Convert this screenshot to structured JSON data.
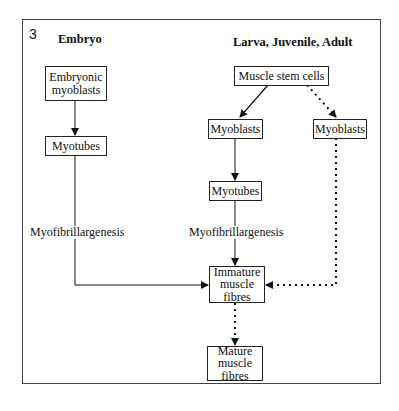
{
  "figure": {
    "panel_number": "3",
    "columns": {
      "left_heading": "Embryo",
      "right_heading": "Larva, Juvenile, Adult"
    },
    "nodes": {
      "embryonic_myoblasts": "Embryonic myoblasts",
      "embryo_myotubes": "Myotubes",
      "muscle_stem_cells": "Muscle stem cells",
      "myoblasts_solid": "Myoblasts",
      "myoblasts_dotted": "Myoblasts",
      "adult_myotubes": "Myotubes",
      "immature_fibres": "Immature muscle fibres",
      "mature_fibres": "Mature muscle fibres"
    },
    "edge_labels": {
      "embryo_myofibrillargenesis": "Myofibrillargenesis",
      "adult_myofibrillargenesis": "Myofibrillargenesis"
    },
    "edges": [
      {
        "from": "Embryonic myoblasts",
        "to": "Myotubes",
        "style": "solid"
      },
      {
        "from": "Myotubes",
        "to": "Immature muscle fibres",
        "style": "solid",
        "label": "Myofibrillargenesis"
      },
      {
        "from": "Muscle stem cells",
        "to": "Myoblasts",
        "style": "solid"
      },
      {
        "from": "Muscle stem cells",
        "to": "Myoblasts",
        "style": "dotted"
      },
      {
        "from": "Myoblasts",
        "to": "Myotubes",
        "style": "solid"
      },
      {
        "from": "Myotubes",
        "to": "Immature muscle fibres",
        "style": "solid",
        "label": "Myofibrillargenesis"
      },
      {
        "from": "Myoblasts",
        "to": "Immature muscle fibres",
        "style": "dotted"
      },
      {
        "from": "Immature muscle fibres",
        "to": "Mature muscle fibres",
        "style": "dotted"
      }
    ]
  }
}
